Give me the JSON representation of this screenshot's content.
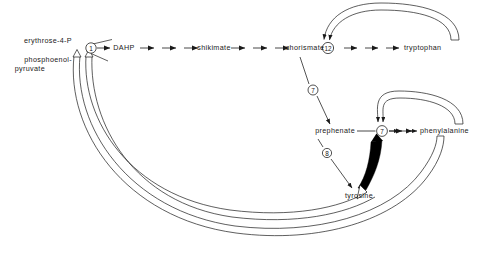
{
  "diagram": {
    "background": "#ffffff",
    "line_color": "#1a1a1a",
    "thick_arrow_color": "#000000"
  },
  "substrates": [
    {
      "id": "erythrose4p",
      "label": "erythrose-4-P",
      "x": 72,
      "y": 41
    },
    {
      "id": "pep_line1",
      "label": "phosphoenol-",
      "x": 72,
      "y": 60
    },
    {
      "id": "pep_line2",
      "label": "pyruvate",
      "x": 72,
      "y": 68
    }
  ],
  "metabolites": [
    {
      "id": "dahp",
      "label": "DAHP",
      "x": 124,
      "y": 48
    },
    {
      "id": "shikimate",
      "label": "shikimate",
      "x": 205,
      "y": 48
    },
    {
      "id": "chorismate",
      "label": "chorismate",
      "x": 296,
      "y": 48
    },
    {
      "id": "tryptophan",
      "label": "tryptophan",
      "x": 424,
      "y": 48
    },
    {
      "id": "prephenate",
      "label": "prephenate",
      "x": 330,
      "y": 131
    },
    {
      "id": "phenylalanine",
      "label": "phenylalanine",
      "x": 432,
      "y": 131
    },
    {
      "id": "tyrosine",
      "label": "tyrosine",
      "x": 357,
      "y": 196
    }
  ],
  "enzyme_nodes": [
    {
      "id": "node-1",
      "number": "1",
      "x": 91,
      "y": 48
    },
    {
      "id": "node-12",
      "number": "12",
      "x": 328,
      "y": 48
    },
    {
      "id": "node-7-branch",
      "number": "7",
      "x": 313,
      "y": 90
    },
    {
      "id": "node-7",
      "number": "7",
      "x": 382,
      "y": 131
    },
    {
      "id": "node-8",
      "number": "8",
      "x": 327,
      "y": 153
    }
  ],
  "feedback_loops": [
    {
      "id": "trp-to-node12",
      "from": "tryptophan",
      "to": "node-12",
      "style": "double-line-arc"
    },
    {
      "id": "phe-to-node7",
      "from": "phenylalanine",
      "to": "node-7",
      "style": "double-line-arc"
    },
    {
      "id": "tyr-to-node7",
      "from": "tyrosine",
      "to": "node-7",
      "style": "thick-solid-arrow"
    },
    {
      "id": "tyr-to-node1",
      "from": "tyrosine",
      "to": "node-1",
      "style": "hollow-band-arc"
    },
    {
      "id": "phe-to-node1",
      "from": "phenylalanine",
      "to": "node-1",
      "style": "hollow-band-arc"
    }
  ],
  "branch_arrows": [
    {
      "id": "chorismate-to-prephenate",
      "from": "chorismate",
      "to": "prephenate",
      "via": "node-7-branch"
    },
    {
      "id": "prephenate-to-tyrosine",
      "from": "prephenate",
      "to": "tyrosine",
      "via": "node-8"
    }
  ]
}
